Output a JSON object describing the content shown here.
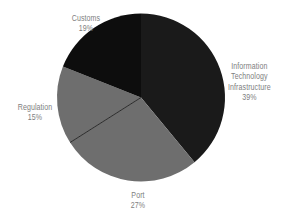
{
  "chart_data": {
    "type": "pie",
    "title": "",
    "subtitle": "",
    "xlabel": "",
    "ylabel": "",
    "legend_position": "none",
    "grid": false,
    "labels_show_percent": true,
    "categories": [
      "Information Technology Infrastructure",
      "Port",
      "Regulation",
      "Customs"
    ],
    "values": [
      39,
      27,
      15,
      19
    ],
    "slices": [
      {
        "name": "Information Technology Infrastructure",
        "label_lines": [
          "Information",
          "Technology",
          "Infrastructure"
        ],
        "value": 39,
        "percent_text": "39%",
        "color": "#1a1a1a",
        "start_angle_deg": 0,
        "end_angle_deg": 140.4
      },
      {
        "name": "Port",
        "label_lines": [
          "Port"
        ],
        "value": 27,
        "percent_text": "27%",
        "color": "#6e6e6e",
        "start_angle_deg": 140.4,
        "end_angle_deg": 237.6
      },
      {
        "name": "Regulation",
        "label_lines": [
          "Regulation"
        ],
        "value": 15,
        "percent_text": "15%",
        "color": "#6e6e6e",
        "start_angle_deg": 237.6,
        "end_angle_deg": 291.6
      },
      {
        "name": "Customs",
        "label_lines": [
          "Customs"
        ],
        "value": 19,
        "percent_text": "19%",
        "color": "#0d0d0d",
        "start_angle_deg": 291.6,
        "end_angle_deg": 360
      }
    ],
    "geometry": {
      "center_x": 141,
      "center_y": 97.5,
      "radius": 84,
      "start_at_12_oclock": true,
      "direction": "clockwise"
    },
    "style": {
      "background": "#ffffff",
      "label_color": "#7e7e7e",
      "divider_color": "#2a2a2a",
      "dark_slice_color": "#1a1a1a",
      "gray_slice_color": "#6e6e6e",
      "darkest_slice_color": "#0d0d0d"
    }
  },
  "labels": {
    "it": {
      "line1": "Information",
      "line2": "Technology",
      "line3": "Infrastructure",
      "percent": "39%"
    },
    "customs": {
      "name": "Customs",
      "percent": "19%"
    },
    "regulation": {
      "name": "Regulation",
      "percent": "15%"
    },
    "port": {
      "name": "Port",
      "percent": "27%"
    }
  }
}
